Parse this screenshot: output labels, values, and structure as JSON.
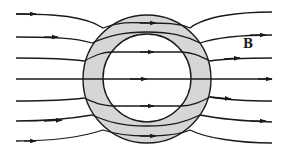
{
  "diagram": {
    "field_label": "B",
    "colors": {
      "line": "#1a1a1a",
      "shell_fill": "#d6d6d6",
      "background": "#ffffff"
    },
    "shell": {
      "center": [
        147,
        79
      ],
      "outer_radius": 64,
      "inner_radius": 44
    },
    "field_lines_count": 7,
    "arrow_direction": "left-to-right"
  }
}
